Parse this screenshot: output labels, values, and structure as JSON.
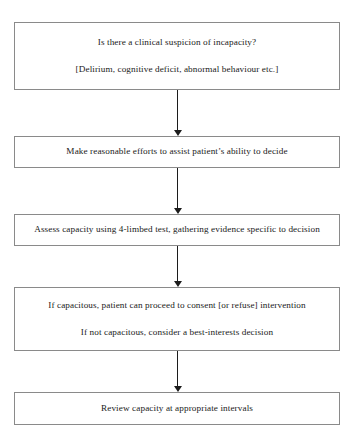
{
  "diagram": {
    "type": "flowchart",
    "orientation": "vertical",
    "colors": {
      "box_border": "#8a8a8a",
      "box_fill": "#ffffff",
      "arrow": "#1c1c1c",
      "text": "#1a1a1a",
      "page_background": "#ffffff"
    },
    "nodes": [
      {
        "id": "node-1",
        "name": "clinical-suspicion-box",
        "lines": [
          "Is there a clinical suspicion of incapacity?",
          "[Delirium, cognitive deficit, abnormal behaviour etc.]"
        ]
      },
      {
        "id": "node-2",
        "name": "assist-ability-box",
        "lines": [
          "Make reasonable efforts to assist patient’s ability to decide"
        ]
      },
      {
        "id": "node-3",
        "name": "assess-capacity-box",
        "lines": [
          "Assess capacity using 4-limbed test, gathering evidence specific to decision"
        ]
      },
      {
        "id": "node-4",
        "name": "capacitous-outcome-box",
        "lines": [
          "If capacitous, patient can proceed to consent [or refuse] intervention",
          "If not capacitous, consider a best-interests decision"
        ]
      },
      {
        "id": "node-5",
        "name": "review-capacity-box",
        "lines": [
          "Review capacity at appropriate intervals"
        ]
      }
    ],
    "connectors": [
      {
        "id": "connector-1",
        "from": "node-1",
        "to": "node-2",
        "icon": "down-arrow-icon"
      },
      {
        "id": "connector-2",
        "from": "node-2",
        "to": "node-3",
        "icon": "down-arrow-icon"
      },
      {
        "id": "connector-3",
        "from": "node-3",
        "to": "node-4",
        "icon": "down-arrow-icon"
      },
      {
        "id": "connector-4",
        "from": "node-4",
        "to": "node-5",
        "icon": "down-arrow-icon"
      }
    ]
  }
}
